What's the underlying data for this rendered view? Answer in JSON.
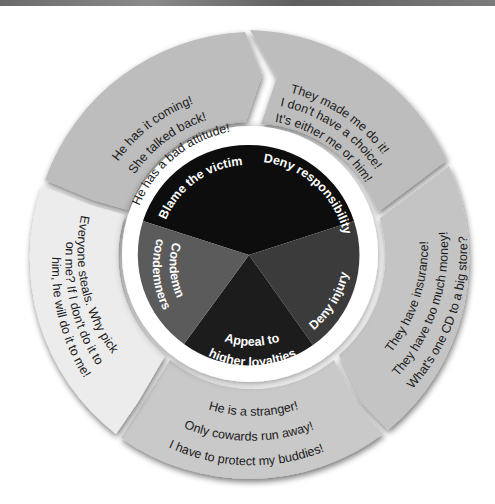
{
  "diagram": {
    "title": "",
    "center_techniques": [
      {
        "id": "blame",
        "label": "Blame the victim",
        "color": "#0d0d0d"
      },
      {
        "id": "deny-resp",
        "label": "Deny responsibility",
        "color": "#0d0d0d"
      },
      {
        "id": "deny-injury",
        "label": "Deny injury",
        "color": "#3b3b3b"
      },
      {
        "id": "appeal",
        "label_line1": "Appeal to",
        "label_line2": "higher loyalties",
        "color": "#1c1c1c"
      },
      {
        "id": "condemn",
        "label_line1": "Condemn",
        "label_line2": "condemners",
        "color": "#5b5b5b"
      }
    ],
    "outer_segments": [
      {
        "id": "blame",
        "lines": [
          "He has it coming!",
          "She talked back!",
          "He has a bad attitude!"
        ],
        "fill": "#bdbdbd"
      },
      {
        "id": "deny-resp",
        "lines": [
          "They made me do it!",
          "I don't have a choice!",
          "It's either me or him!"
        ],
        "fill": "#bdbdbd"
      },
      {
        "id": "deny-injury",
        "lines": [
          "They have insurance!",
          "They have too much money!",
          "What's one CD to a big store?"
        ],
        "fill": "#c4c4c4"
      },
      {
        "id": "appeal",
        "lines": [
          "He is a stranger!",
          "Only cowards run away!",
          "I have to protect my buddies!"
        ],
        "fill": "#c9c9c9"
      },
      {
        "id": "condemn",
        "lines": [
          "Everyone steals. Why pick",
          "on me? If I don't do it to",
          "him, he will do it to me!"
        ],
        "fill": "#ececec"
      }
    ],
    "colors": {
      "ring_white": "#ffffff",
      "segment_shadow": "#8a8a8a",
      "text_dark": "#1a1a1a",
      "text_light": "#ffffff"
    }
  }
}
